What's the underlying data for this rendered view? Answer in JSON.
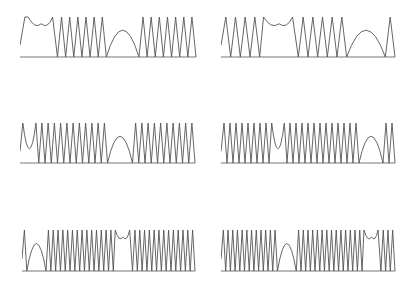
{
  "chart_data": [
    {
      "type": "line",
      "title": "",
      "xlabel": "",
      "ylabel": "",
      "grid": false,
      "description": "Row 1 left: double-hump, 6 spikes, arc, 7 spikes",
      "segments": [
        [
          "rise",
          1
        ],
        [
          "hump2",
          1
        ],
        [
          "tri",
          6
        ],
        [
          "arc",
          1
        ],
        [
          "tri",
          7
        ]
      ],
      "box": {
        "x": 20,
        "y": 16,
        "w": 176,
        "h": 41
      }
    },
    {
      "type": "line",
      "title": "",
      "xlabel": "",
      "ylabel": "",
      "grid": false,
      "description": "Row 1 right: 4 spikes, double-hump, 5 spikes, arc, partial spike",
      "segments": [
        [
          "tri",
          4
        ],
        [
          "hump2",
          1
        ],
        [
          "tri",
          5
        ],
        [
          "arc",
          1
        ],
        [
          "tri",
          1
        ]
      ],
      "box": {
        "x": 221,
        "y": 16,
        "w": 174,
        "h": 41
      }
    },
    {
      "type": "line",
      "title": "",
      "xlabel": "",
      "ylabel": "",
      "grid": false,
      "description": "Row 2 left: dip-hump, 11 spikes, arc, 10 spikes",
      "segments": [
        [
          "dip",
          1
        ],
        [
          "tri",
          11
        ],
        [
          "arc",
          1
        ],
        [
          "tri",
          10
        ]
      ],
      "box": {
        "x": 20,
        "y": 122,
        "w": 175,
        "h": 41
      }
    },
    {
      "type": "line",
      "title": "",
      "xlabel": "",
      "ylabel": "",
      "grid": false,
      "description": "Row 2 right: 8 spikes, dip, 12 spikes, arc, 2 spikes",
      "segments": [
        [
          "tri",
          8
        ],
        [
          "dip",
          1
        ],
        [
          "tri",
          12
        ],
        [
          "arc",
          1
        ],
        [
          "tri",
          2
        ]
      ],
      "box": {
        "x": 221,
        "y": 122,
        "w": 174,
        "h": 41
      }
    },
    {
      "type": "line",
      "title": "",
      "xlabel": "",
      "ylabel": "",
      "grid": false,
      "description": "Row 3 left: spike, arc, 14 spikes, double-hump, 13 spikes",
      "segments": [
        [
          "tri",
          1
        ],
        [
          "arc",
          1
        ],
        [
          "tri",
          14
        ],
        [
          "hump2",
          1
        ],
        [
          "tri",
          13
        ]
      ],
      "box": {
        "x": 22,
        "y": 229,
        "w": 173,
        "h": 42
      }
    },
    {
      "type": "line",
      "title": "",
      "xlabel": "",
      "ylabel": "",
      "grid": false,
      "description": "Row 3 right: 12 spikes, arc, 14 spikes, double-hump, 3 spikes",
      "segments": [
        [
          "tri",
          12
        ],
        [
          "arc",
          1
        ],
        [
          "tri",
          14
        ],
        [
          "hump2",
          1
        ],
        [
          "tri",
          3
        ]
      ],
      "box": {
        "x": 221,
        "y": 229,
        "w": 174,
        "h": 42
      }
    }
  ],
  "style": {
    "line_color": "#555555",
    "axis_color": "#777777",
    "background": "#ffffff"
  }
}
